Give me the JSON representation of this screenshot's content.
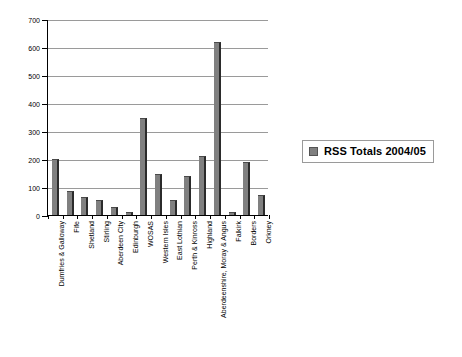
{
  "chart_data": {
    "type": "bar",
    "title": "",
    "xlabel": "",
    "ylabel": "",
    "ylim": [
      0,
      700
    ],
    "ytick_step": 100,
    "yticks": [
      0,
      100,
      200,
      300,
      400,
      500,
      600,
      700
    ],
    "grid": true,
    "legend_position": "right",
    "categories": [
      "Dumfries & Galloway",
      "Fife",
      "Shetland",
      "Stirling",
      "Aberdeen City",
      "Edinburgh",
      "WOSAS",
      "Western Isles",
      "East Lothian",
      "Perth & Kinross",
      "Highland",
      "Aberdeenshire, Moray & Angus",
      "Falkirk",
      "Borders",
      "Orkney"
    ],
    "series": [
      {
        "name": "RSS Totals 2004/05",
        "color": "#808080",
        "values": [
          200,
          85,
          65,
          55,
          30,
          10,
          345,
          145,
          52,
          140,
          212,
          618,
          12,
          190,
          72
        ]
      }
    ]
  },
  "legend": {
    "entries": [
      {
        "label": "RSS Totals 2004/05",
        "swatch_color": "#808080"
      }
    ]
  },
  "axis": {
    "y_tick_labels": [
      "0",
      "100",
      "200",
      "300",
      "400",
      "500",
      "600",
      "700"
    ]
  },
  "colors": {
    "bar_fill": "#808080",
    "bar_edge": "#2b2b2b",
    "gridline": "#9a9a9a",
    "axis": "#000000",
    "background": "#ffffff"
  }
}
